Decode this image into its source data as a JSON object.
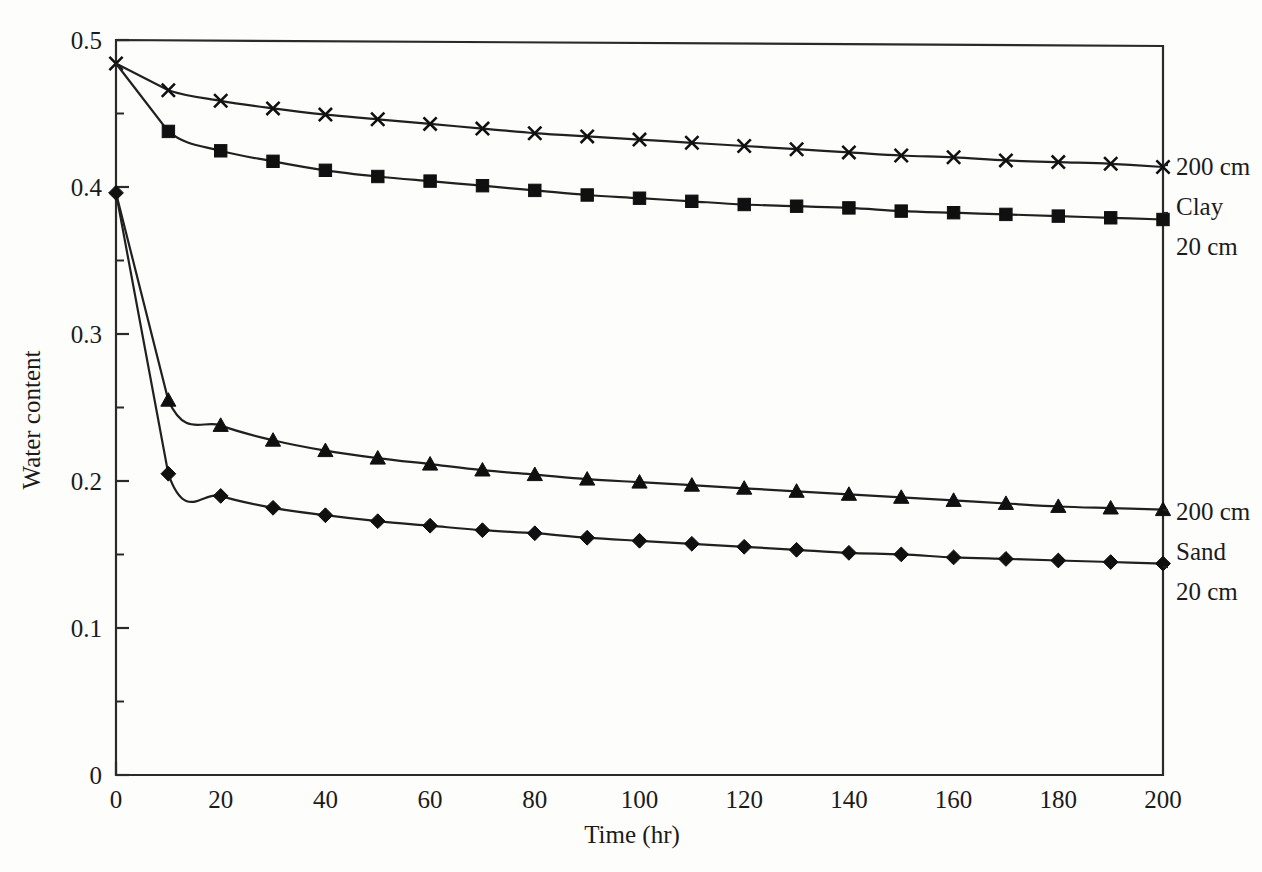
{
  "figure": {
    "background": "#fdfdfc",
    "ink_color": "#202020"
  },
  "axes": {
    "x_title": "Time (hr)",
    "y_title": "Water content",
    "x_ticks": [
      "0",
      "20",
      "40",
      "60",
      "80",
      "100",
      "120",
      "140",
      "160",
      "180",
      "200"
    ],
    "y_ticks": [
      "0",
      "0.1",
      "0.2",
      "0.3",
      "0.4",
      "0.5"
    ],
    "x_minor_step": 10,
    "y_minor_step": 0.05
  },
  "annotations": {
    "clay_top": "200 cm",
    "clay_mid": "Clay",
    "clay_bottom": "20 cm",
    "sand_top": "200 cm",
    "sand_mid": "Sand",
    "sand_bottom": "20 cm"
  },
  "chart_data": {
    "type": "line",
    "title": "",
    "xlabel": "Time (hr)",
    "ylabel": "Water content",
    "xlim": [
      0,
      200
    ],
    "ylim": [
      0,
      0.5
    ],
    "grid": false,
    "legend_position": "right-of-plot (inline end-of-line labels)",
    "x": [
      0,
      10,
      20,
      30,
      40,
      50,
      60,
      70,
      80,
      90,
      100,
      110,
      120,
      130,
      140,
      150,
      160,
      170,
      180,
      190,
      200
    ],
    "series": [
      {
        "name": "Clay 200 cm",
        "marker": "x",
        "label": "200 cm",
        "group": "Clay",
        "values": [
          0.484,
          0.466,
          0.459,
          0.454,
          0.45,
          0.447,
          0.444,
          0.441,
          0.438,
          0.436,
          0.434,
          0.432,
          0.43,
          0.428,
          0.426,
          0.424,
          0.423,
          0.421,
          0.42,
          0.419,
          0.417
        ]
      },
      {
        "name": "Clay 20 cm",
        "marker": "square",
        "label": "20 cm",
        "group": "Clay",
        "values": [
          0.484,
          0.438,
          0.425,
          0.418,
          0.412,
          0.408,
          0.405,
          0.402,
          0.399,
          0.396,
          0.394,
          0.392,
          0.39,
          0.389,
          0.388,
          0.386,
          0.385,
          0.384,
          0.383,
          0.382,
          0.381
        ]
      },
      {
        "name": "Sand 200 cm",
        "marker": "triangle",
        "label": "200 cm",
        "group": "Sand",
        "values": [
          0.396,
          0.255,
          0.238,
          0.228,
          0.221,
          0.216,
          0.212,
          0.208,
          0.205,
          0.202,
          0.2,
          0.198,
          0.196,
          0.194,
          0.192,
          0.19,
          0.188,
          0.186,
          0.184,
          0.183,
          0.182
        ]
      },
      {
        "name": "Sand 20 cm",
        "marker": "diamond",
        "label": "20 cm",
        "group": "Sand",
        "values": [
          0.396,
          0.205,
          0.19,
          0.182,
          0.177,
          0.173,
          0.17,
          0.167,
          0.165,
          0.162,
          0.16,
          0.158,
          0.156,
          0.154,
          0.152,
          0.151,
          0.149,
          0.148,
          0.147,
          0.146,
          0.145
        ]
      }
    ]
  }
}
